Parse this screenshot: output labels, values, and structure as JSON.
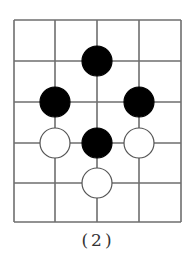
{
  "diagram": {
    "type": "go-board-fragment",
    "grid": {
      "x_lines": [
        14,
        55,
        97,
        139,
        181
      ],
      "y_lines": [
        20,
        61,
        102,
        143,
        183,
        222
      ],
      "line_color": "#6e6e6e"
    },
    "stone_radius": 15,
    "stones": [
      {
        "color": "black",
        "col": 2,
        "row": 1
      },
      {
        "color": "black",
        "col": 1,
        "row": 2
      },
      {
        "color": "black",
        "col": 3,
        "row": 2
      },
      {
        "color": "white",
        "col": 1,
        "row": 3
      },
      {
        "color": "black",
        "col": 2,
        "row": 3
      },
      {
        "color": "white",
        "col": 3,
        "row": 3
      },
      {
        "color": "white",
        "col": 2,
        "row": 4
      }
    ],
    "colors": {
      "black": "#000000",
      "white": "#ffffff",
      "stroke": "#555555"
    }
  },
  "caption": "(2)"
}
